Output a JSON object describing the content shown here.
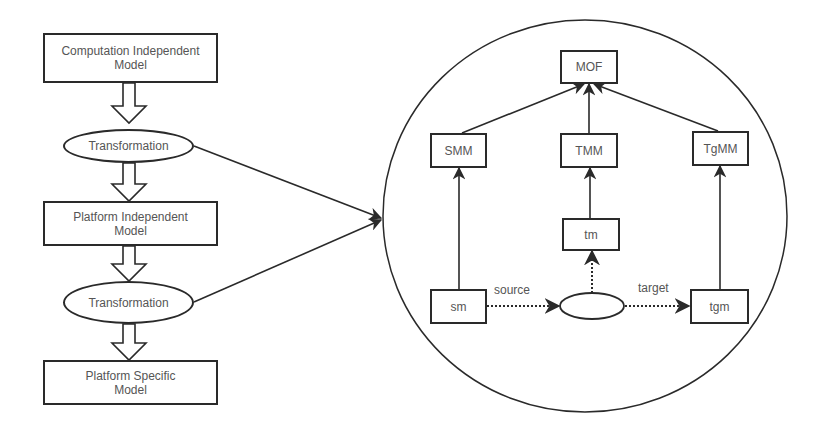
{
  "diagram": {
    "left_flow": {
      "nodes": [
        {
          "id": "cim",
          "type": "box",
          "label": "Computation Independent\nModel"
        },
        {
          "id": "t1",
          "type": "ellipse",
          "label": "Transformation"
        },
        {
          "id": "pim",
          "type": "box",
          "label": "Platform Independent\nModel"
        },
        {
          "id": "t2",
          "type": "ellipse",
          "label": "Transformation"
        },
        {
          "id": "psm",
          "type": "box",
          "label": "Platform Specific\nModel"
        }
      ],
      "edges": [
        {
          "from": "cim",
          "to": "t1",
          "style": "hollow-block-arrow"
        },
        {
          "from": "t1",
          "to": "pim",
          "style": "hollow-block-arrow"
        },
        {
          "from": "pim",
          "to": "t2",
          "style": "hollow-block-arrow"
        },
        {
          "from": "t2",
          "to": "psm",
          "style": "hollow-block-arrow"
        },
        {
          "from": "t1",
          "to": "detail-circle",
          "style": "solid-arrow"
        },
        {
          "from": "t2",
          "to": "detail-circle",
          "style": "solid-arrow"
        }
      ]
    },
    "detail": {
      "nodes": [
        {
          "id": "mof",
          "label": "MOF"
        },
        {
          "id": "smm",
          "label": "SMM"
        },
        {
          "id": "tmm",
          "label": "TMM"
        },
        {
          "id": "tgmm",
          "label": "TgMM"
        },
        {
          "id": "tm",
          "label": "tm"
        },
        {
          "id": "sm",
          "label": "sm"
        },
        {
          "id": "transform",
          "label": ""
        },
        {
          "id": "tgm",
          "label": "tgm"
        }
      ],
      "edges": [
        {
          "from": "smm",
          "to": "mof",
          "style": "solid-arrow"
        },
        {
          "from": "tmm",
          "to": "mof",
          "style": "solid-arrow"
        },
        {
          "from": "tgmm",
          "to": "mof",
          "style": "solid-arrow"
        },
        {
          "from": "sm",
          "to": "smm",
          "style": "solid-arrow"
        },
        {
          "from": "tm",
          "to": "tmm",
          "style": "solid-arrow"
        },
        {
          "from": "tgm",
          "to": "tgmm",
          "style": "solid-arrow"
        },
        {
          "from": "transform",
          "to": "tm",
          "style": "dotted-arrow"
        },
        {
          "from": "sm",
          "to": "transform",
          "style": "dotted-arrow",
          "label": "source"
        },
        {
          "from": "transform",
          "to": "tgm",
          "style": "dotted-arrow",
          "label": "target"
        }
      ],
      "edge_labels": {
        "source": "source",
        "target": "target"
      }
    },
    "colors": {
      "stroke": "#2a2a2a",
      "text": "#555555",
      "background": "#ffffff"
    }
  },
  "labels": {
    "cim_line1": "Computation Independent",
    "cim_line2": "Model",
    "t1": "Transformation",
    "pim_line1": "Platform Independent",
    "pim_line2": "Model",
    "t2": "Transformation",
    "psm_line1": "Platform Specific",
    "psm_line2": "Model",
    "mof": "MOF",
    "smm": "SMM",
    "tmm": "TMM",
    "tgmm": "TgMM",
    "tm": "tm",
    "sm": "sm",
    "tgm": "tgm",
    "source": "source",
    "target": "target"
  }
}
